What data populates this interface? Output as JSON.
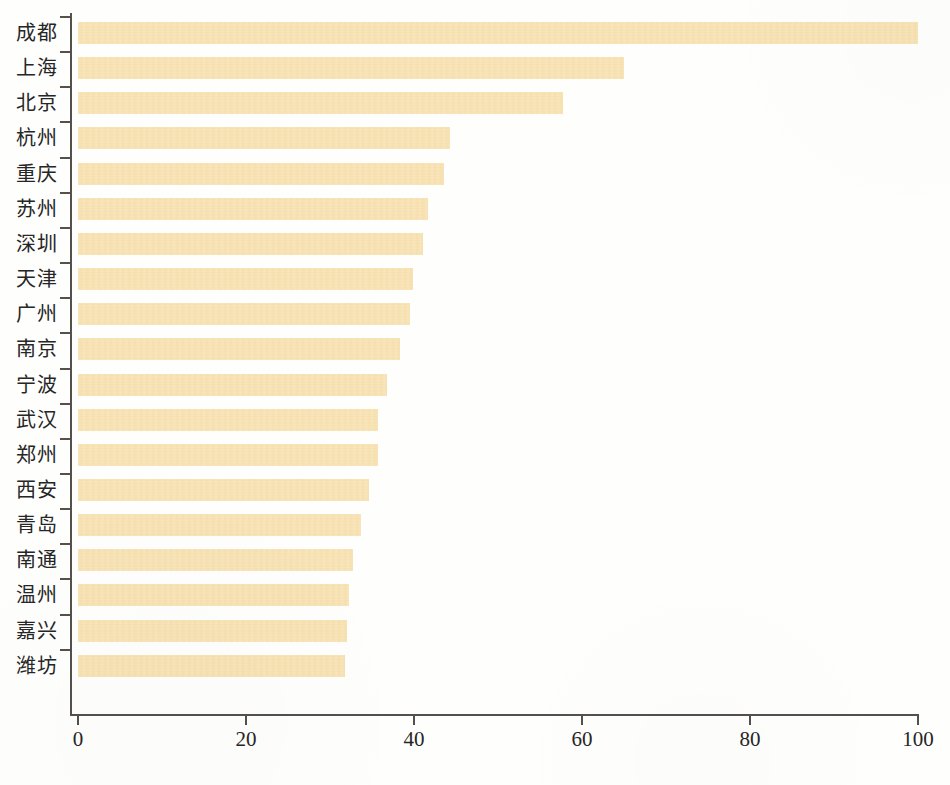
{
  "chart_data": {
    "type": "bar",
    "orientation": "horizontal",
    "title": "",
    "subtitle": "",
    "xlabel": "",
    "ylabel": "",
    "categories": [
      "成都",
      "上海",
      "北京",
      "杭州",
      "重庆",
      "苏州",
      "深圳",
      "天津",
      "广州",
      "南京",
      "宁波",
      "武汉",
      "郑州",
      "西安",
      "青岛",
      "南通",
      "温州",
      "嘉兴",
      "潍坊"
    ],
    "values": [
      100,
      65,
      57.7,
      44.3,
      43.6,
      41.7,
      41.1,
      39.9,
      39.5,
      38.3,
      36.8,
      35.7,
      35.7,
      34.6,
      33.7,
      32.7,
      32.3,
      32.0,
      31.8
    ],
    "series": [
      {
        "name": "",
        "values": [
          100,
          65,
          57.7,
          44.3,
          43.6,
          41.7,
          41.1,
          39.9,
          39.5,
          38.3,
          36.8,
          35.7,
          35.7,
          34.6,
          33.7,
          32.7,
          32.3,
          32.0,
          31.8
        ]
      }
    ],
    "xlim": [
      0,
      100
    ],
    "xticks": [
      0,
      20,
      40,
      60,
      80,
      100
    ],
    "xticklabels": [
      "0",
      "20",
      "40",
      "60",
      "80",
      "100"
    ],
    "yticklabels": [
      "成都",
      "上海",
      "北京",
      "杭州",
      "重庆",
      "苏州",
      "深圳",
      "天津",
      "广州",
      "南京",
      "宁波",
      "武汉",
      "郑州",
      "西安",
      "青岛",
      "南通",
      "温州",
      "嘉兴",
      "潍坊"
    ],
    "grid": false,
    "legend": null,
    "legend_position": "none",
    "annotations": [],
    "bar_color": "#f7e0ae",
    "axis_color": "#54504c",
    "text_color": "#262626",
    "background_color": "#fefefd"
  }
}
